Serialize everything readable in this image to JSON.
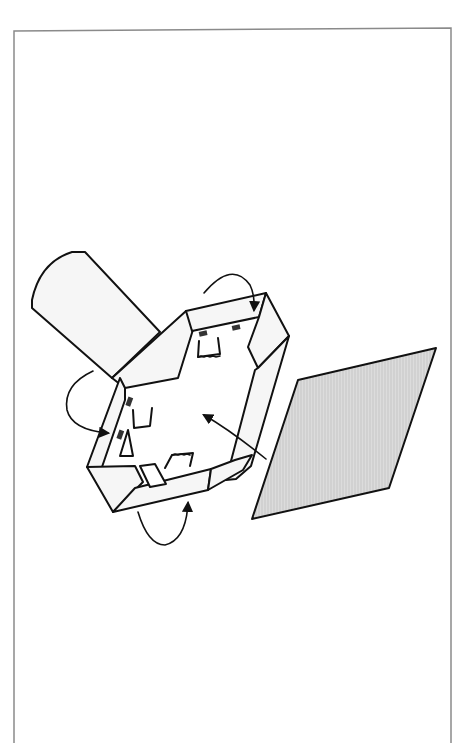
{
  "figure": {
    "type": "assembly-instruction-illustration",
    "caption": "",
    "colors": {
      "background": "#ffffff",
      "border": "#8a8a8a",
      "line": "#111111",
      "part_fill": "#f6f6f6",
      "panel_fill": "#d9d9d9",
      "panel_hatch": "#c4c4c4"
    },
    "elements": [
      {
        "name": "outer-border",
        "description": "thin grey page frame open at bottom"
      },
      {
        "name": "roller-tube",
        "description": "rounded cylindrical tube behind frame, upper left"
      },
      {
        "name": "mat-frame",
        "description": "hexagonal folded frame with four flaps and tape tabs"
      },
      {
        "name": "tape-tabs",
        "count": 4
      },
      {
        "name": "panel",
        "description": "grey hatched parallelogram sheet to the right"
      },
      {
        "name": "fold-arrows",
        "count": 3,
        "description": "curved arrows showing flaps folding over"
      },
      {
        "name": "insert-arrow",
        "count": 1,
        "description": "arrow showing panel inserted into frame"
      }
    ]
  }
}
